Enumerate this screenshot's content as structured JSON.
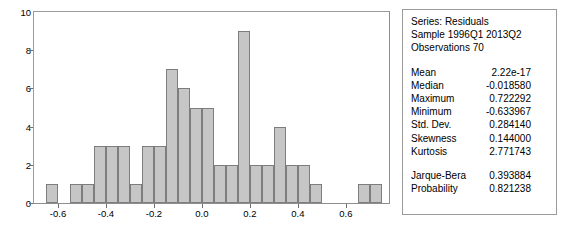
{
  "chart_data": {
    "type": "bar",
    "title": "",
    "xlabel": "",
    "ylabel": "",
    "grid": false,
    "legend_position": "none",
    "bin_width": 0.05,
    "bin_starts": [
      -0.65,
      -0.6,
      -0.55,
      -0.5,
      -0.45,
      -0.4,
      -0.35,
      -0.3,
      -0.25,
      -0.2,
      -0.15,
      -0.1,
      -0.05,
      0.0,
      0.05,
      0.1,
      0.15,
      0.2,
      0.25,
      0.3,
      0.35,
      0.4,
      0.45,
      0.5,
      0.55,
      0.6,
      0.65,
      0.7
    ],
    "categories": [
      "-0.65",
      "-0.60",
      "-0.55",
      "-0.50",
      "-0.45",
      "-0.40",
      "-0.35",
      "-0.30",
      "-0.25",
      "-0.20",
      "-0.15",
      "-0.10",
      "-0.05",
      "0.00",
      "0.05",
      "0.10",
      "0.15",
      "0.20",
      "0.25",
      "0.30",
      "0.35",
      "0.40",
      "0.45",
      "0.50",
      "0.55",
      "0.60",
      "0.65",
      "0.70"
    ],
    "values": [
      1,
      0,
      1,
      1,
      3,
      3,
      3,
      1,
      3,
      3,
      7,
      6,
      5,
      5,
      2,
      2,
      9,
      2,
      2,
      4,
      2,
      2,
      1,
      0,
      0,
      0,
      1,
      1
    ],
    "xlim": [
      -0.7,
      0.78
    ],
    "ylim": [
      0,
      10
    ],
    "yticks": [
      0,
      2,
      4,
      6,
      8,
      10
    ],
    "xticks": [
      -0.6,
      -0.4,
      -0.2,
      0.0,
      0.2,
      0.4,
      0.6
    ],
    "xtick_labels": [
      "-0.6",
      "-0.4",
      "-0.2",
      "0.0",
      "0.2",
      "0.4",
      "0.6"
    ],
    "ytick_labels": [
      "0",
      "2",
      "4",
      "6",
      "8",
      "10"
    ],
    "bar_color": "#c6c6c6",
    "bar_edge_color": "#7d7d7d",
    "axis_color": "#8e8e8e"
  },
  "stats": {
    "series_line": "Series: Residuals",
    "sample_line": "Sample 1996Q1 2013Q2",
    "observations_line": "Observations 70",
    "rows": [
      {
        "label": "Mean",
        "value": "2.22e-17"
      },
      {
        "label": "Median",
        "value": "-0.018580"
      },
      {
        "label": "Maximum",
        "value": "0.722292"
      },
      {
        "label": "Minimum",
        "value": "-0.633967"
      },
      {
        "label": "Std. Dev.",
        "value": "0.284140"
      },
      {
        "label": "Skewness",
        "value": "0.144000"
      },
      {
        "label": "Kurtosis",
        "value": "2.771743"
      }
    ],
    "test_rows": [
      {
        "label": "Jarque-Bera",
        "value": "0.393884"
      },
      {
        "label": "Probability",
        "value": "0.821238"
      }
    ]
  }
}
